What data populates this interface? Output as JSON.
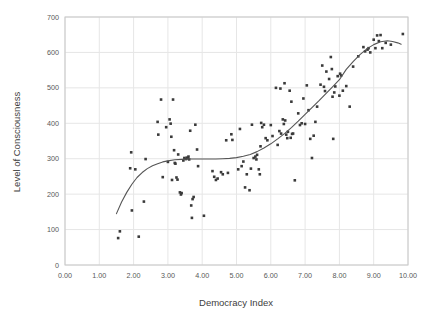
{
  "chart_data": {
    "type": "scatter",
    "title": "",
    "xlabel": "Democracy Index",
    "ylabel": "Level of Consciousness",
    "xlim": [
      0.0,
      10.0
    ],
    "ylim": [
      0,
      700
    ],
    "xticks": [
      "0.00",
      "1.00",
      "2.00",
      "3.00",
      "4.00",
      "5.00",
      "6.00",
      "7.00",
      "8.00",
      "9.00",
      "10.00"
    ],
    "yticks": [
      "0",
      "100",
      "200",
      "300",
      "400",
      "500",
      "600",
      "700"
    ],
    "xtick_values": [
      0,
      1,
      2,
      3,
      4,
      5,
      6,
      7,
      8,
      9,
      10
    ],
    "ytick_values": [
      0,
      100,
      200,
      300,
      400,
      500,
      600,
      700
    ],
    "grid": true,
    "grid_color": "#e6e6e6",
    "frame_color": "#c8c8c8",
    "legend": "none",
    "marker": {
      "shape": "square",
      "size_px": 2.6,
      "color": "#3a3a3a"
    },
    "trendline": {
      "name": "smoothed fit",
      "color": "#555555",
      "width_px": 1.1,
      "points": [
        [
          1.5,
          145
        ],
        [
          1.65,
          178
        ],
        [
          1.8,
          205
        ],
        [
          1.95,
          228
        ],
        [
          2.1,
          247
        ],
        [
          2.25,
          261
        ],
        [
          2.4,
          272
        ],
        [
          2.55,
          280
        ],
        [
          2.7,
          286
        ],
        [
          2.85,
          291
        ],
        [
          3.0,
          294
        ],
        [
          3.2,
          297
        ],
        [
          3.4,
          298
        ],
        [
          3.6,
          299
        ],
        [
          3.8,
          299
        ],
        [
          4.0,
          299
        ],
        [
          4.2,
          299
        ],
        [
          4.4,
          299
        ],
        [
          4.6,
          300
        ],
        [
          4.8,
          301
        ],
        [
          5.0,
          303
        ],
        [
          5.2,
          307
        ],
        [
          5.4,
          312
        ],
        [
          5.6,
          320
        ],
        [
          5.8,
          330
        ],
        [
          6.0,
          342
        ],
        [
          6.2,
          356
        ],
        [
          6.4,
          371
        ],
        [
          6.6,
          388
        ],
        [
          6.8,
          406
        ],
        [
          7.0,
          425
        ],
        [
          7.2,
          444
        ],
        [
          7.4,
          463
        ],
        [
          7.6,
          483
        ],
        [
          7.8,
          503
        ],
        [
          8.0,
          523
        ],
        [
          8.2,
          552
        ],
        [
          8.4,
          574
        ],
        [
          8.6,
          594
        ],
        [
          8.8,
          610
        ],
        [
          9.0,
          622
        ],
        [
          9.2,
          630
        ],
        [
          9.4,
          633
        ],
        [
          9.55,
          631
        ],
        [
          9.7,
          627
        ],
        [
          9.8,
          623
        ]
      ]
    },
    "points": [
      [
        1.55,
        76
      ],
      [
        1.6,
        95
      ],
      [
        2.15,
        80
      ],
      [
        1.93,
        318
      ],
      [
        1.9,
        273
      ],
      [
        1.95,
        154
      ],
      [
        2.05,
        270
      ],
      [
        2.3,
        179
      ],
      [
        2.35,
        299
      ],
      [
        2.7,
        404
      ],
      [
        2.72,
        368
      ],
      [
        2.8,
        467
      ],
      [
        2.85,
        248
      ],
      [
        2.95,
        389
      ],
      [
        3.0,
        291
      ],
      [
        3.05,
        411
      ],
      [
        3.08,
        399
      ],
      [
        3.1,
        362
      ],
      [
        3.12,
        240
      ],
      [
        3.15,
        467
      ],
      [
        3.18,
        324
      ],
      [
        3.2,
        288
      ],
      [
        3.22,
        286
      ],
      [
        3.25,
        247
      ],
      [
        3.28,
        241
      ],
      [
        3.3,
        312
      ],
      [
        3.35,
        205
      ],
      [
        3.38,
        199
      ],
      [
        3.4,
        203
      ],
      [
        3.45,
        295
      ],
      [
        3.48,
        302
      ],
      [
        3.52,
        299
      ],
      [
        3.55,
        303
      ],
      [
        3.58,
        301
      ],
      [
        3.6,
        306
      ],
      [
        3.62,
        298
      ],
      [
        3.65,
        379
      ],
      [
        3.68,
        168
      ],
      [
        3.7,
        133
      ],
      [
        3.72,
        186
      ],
      [
        3.75,
        192
      ],
      [
        3.8,
        396
      ],
      [
        3.85,
        326
      ],
      [
        3.88,
        279
      ],
      [
        4.05,
        139
      ],
      [
        4.3,
        265
      ],
      [
        4.35,
        249
      ],
      [
        4.4,
        240
      ],
      [
        4.45,
        244
      ],
      [
        4.55,
        262
      ],
      [
        4.6,
        256
      ],
      [
        4.7,
        352
      ],
      [
        4.75,
        260
      ],
      [
        4.85,
        369
      ],
      [
        4.88,
        353
      ],
      [
        5.05,
        270
      ],
      [
        5.1,
        384
      ],
      [
        5.15,
        279
      ],
      [
        5.2,
        292
      ],
      [
        5.25,
        219
      ],
      [
        5.3,
        256
      ],
      [
        5.38,
        211
      ],
      [
        5.42,
        272
      ],
      [
        5.45,
        396
      ],
      [
        5.5,
        302
      ],
      [
        5.55,
        306
      ],
      [
        5.58,
        298
      ],
      [
        5.6,
        311
      ],
      [
        5.65,
        270
      ],
      [
        5.68,
        256
      ],
      [
        5.7,
        335
      ],
      [
        5.72,
        401
      ],
      [
        5.75,
        389
      ],
      [
        5.8,
        396
      ],
      [
        5.85,
        358
      ],
      [
        5.9,
        352
      ],
      [
        6.0,
        395
      ],
      [
        6.05,
        364
      ],
      [
        6.15,
        500
      ],
      [
        6.2,
        339
      ],
      [
        6.25,
        378
      ],
      [
        6.28,
        498
      ],
      [
        6.3,
        371
      ],
      [
        6.35,
        411
      ],
      [
        6.38,
        398
      ],
      [
        6.4,
        513
      ],
      [
        6.42,
        408
      ],
      [
        6.45,
        368
      ],
      [
        6.48,
        358
      ],
      [
        6.5,
        376
      ],
      [
        6.55,
        492
      ],
      [
        6.58,
        359
      ],
      [
        6.6,
        461
      ],
      [
        6.62,
        370
      ],
      [
        6.65,
        371
      ],
      [
        6.7,
        239
      ],
      [
        6.8,
        428
      ],
      [
        6.85,
        395
      ],
      [
        6.9,
        400
      ],
      [
        6.95,
        470
      ],
      [
        7.0,
        398
      ],
      [
        7.05,
        507
      ],
      [
        7.1,
        437
      ],
      [
        7.15,
        356
      ],
      [
        7.2,
        302
      ],
      [
        7.25,
        365
      ],
      [
        7.3,
        404
      ],
      [
        7.35,
        447
      ],
      [
        7.45,
        509
      ],
      [
        7.5,
        563
      ],
      [
        7.55,
        503
      ],
      [
        7.58,
        491
      ],
      [
        7.62,
        546
      ],
      [
        7.7,
        525
      ],
      [
        7.75,
        587
      ],
      [
        7.78,
        553
      ],
      [
        7.8,
        475
      ],
      [
        7.82,
        356
      ],
      [
        7.85,
        487
      ],
      [
        7.88,
        504
      ],
      [
        7.95,
        533
      ],
      [
        8.0,
        478
      ],
      [
        8.02,
        540
      ],
      [
        8.05,
        535
      ],
      [
        8.1,
        492
      ],
      [
        8.2,
        505
      ],
      [
        8.3,
        447
      ],
      [
        8.4,
        560
      ],
      [
        8.55,
        589
      ],
      [
        8.7,
        615
      ],
      [
        8.75,
        603
      ],
      [
        8.82,
        608
      ],
      [
        8.85,
        612
      ],
      [
        8.9,
        600
      ],
      [
        9.0,
        636
      ],
      [
        9.05,
        612
      ],
      [
        9.1,
        648
      ],
      [
        9.15,
        632
      ],
      [
        9.2,
        649
      ],
      [
        9.25,
        612
      ],
      [
        9.35,
        627
      ],
      [
        9.5,
        622
      ],
      [
        9.85,
        652
      ]
    ]
  }
}
